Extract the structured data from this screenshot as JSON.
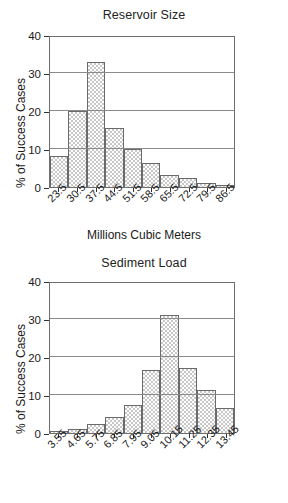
{
  "figure": {
    "background": "#ffffff",
    "bar_fill": "#c8c8c8",
    "bar_edge": "#6a6a6a",
    "grid_color": "#8a8a8a"
  },
  "chart_data": [
    {
      "type": "bar",
      "title": "Reservoir Size",
      "xlabel": "Millions Cubic Meters",
      "ylabel": "% of Success Cases",
      "categories": [
        "23.5",
        "30.5",
        "37.5",
        "44.5",
        "51.5",
        "58.5",
        "65.5",
        "72.5",
        "79.5",
        "86.5"
      ],
      "values": [
        8.2,
        20.0,
        33.0,
        15.5,
        10.0,
        6.4,
        3.2,
        2.4,
        1.1,
        0.6
      ],
      "ylim": [
        0,
        40
      ],
      "yticks": [
        "0",
        "10",
        "20",
        "30",
        "40"
      ],
      "ytick_values": [
        0,
        10,
        20,
        30,
        40
      ],
      "grid": "horizontal",
      "legend": "none"
    },
    {
      "type": "bar",
      "title": "Sediment Load",
      "xlabel": "Integer Percent",
      "ylabel": "% of Success Cases",
      "categories": [
        "3.55",
        "4.65",
        "5.75",
        "6.85",
        "7.95",
        "9.05",
        "10.15",
        "11.25",
        "12.35",
        "13.45"
      ],
      "values": [
        0.6,
        1.1,
        2.4,
        4.1,
        7.5,
        16.5,
        31.0,
        17.2,
        11.2,
        6.7
      ],
      "ylim": [
        0,
        40
      ],
      "yticks": [
        "0",
        "10",
        "20",
        "30",
        "40"
      ],
      "ytick_values": [
        0,
        10,
        20,
        30,
        40
      ],
      "grid": "horizontal",
      "legend": "none"
    }
  ]
}
